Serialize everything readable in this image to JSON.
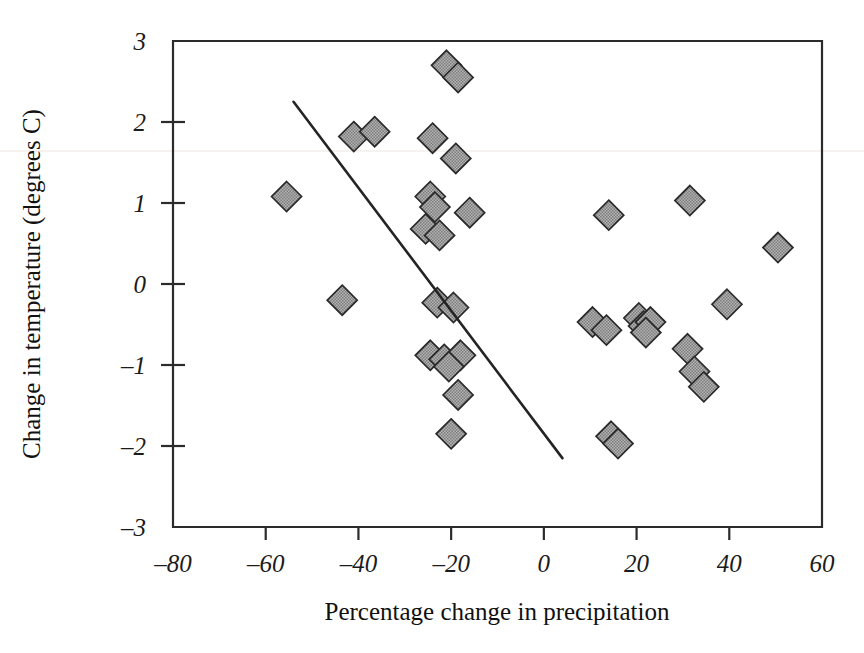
{
  "figure": {
    "background_color": "#ffffff",
    "ink_color": "#2b2b2b"
  },
  "chart_data": {
    "type": "scatter",
    "title": "",
    "subtitle": "",
    "xlabel": "Percentage change in precipitation",
    "ylabel": "Change in temperature (degrees C)",
    "xlim": [
      -80,
      60
    ],
    "ylim": [
      -3,
      3
    ],
    "xticks": [
      -80,
      -60,
      -40,
      -20,
      0,
      20,
      40,
      60
    ],
    "xtick_labels": [
      "–80",
      "–60",
      "–40",
      "–20",
      "0",
      "20",
      "40",
      "60"
    ],
    "yticks": [
      -3,
      -2,
      -1,
      0,
      1,
      2,
      3
    ],
    "ytick_labels": [
      "–3",
      "–2",
      "–1",
      "0",
      "1",
      "2",
      "3"
    ],
    "grid": false,
    "legend": null,
    "legend_position": "none",
    "marker_style": "diamond",
    "marker_fill": "#9a9a9a",
    "marker_edge": "#2a2a2a",
    "marker_size_px": 30,
    "series": [
      {
        "name": "GCM scenarios",
        "points": [
          [
            -21.0,
            2.7
          ],
          [
            -18.5,
            2.55
          ],
          [
            -41.0,
            1.82
          ],
          [
            -36.5,
            1.88
          ],
          [
            -24.0,
            1.8
          ],
          [
            -19.0,
            1.55
          ],
          [
            -55.5,
            1.08
          ],
          [
            -24.5,
            1.08
          ],
          [
            -23.5,
            0.95
          ],
          [
            -16.0,
            0.88
          ],
          [
            -25.5,
            0.68
          ],
          [
            -22.5,
            0.6
          ],
          [
            14.0,
            0.85
          ],
          [
            31.5,
            1.03
          ],
          [
            50.5,
            0.45
          ],
          [
            -43.5,
            -0.2
          ],
          [
            -23.0,
            -0.23
          ],
          [
            -19.5,
            -0.29
          ],
          [
            -24.5,
            -0.88
          ],
          [
            -21.5,
            -0.93
          ],
          [
            -18.0,
            -0.88
          ],
          [
            -20.5,
            -1.02
          ],
          [
            -18.5,
            -1.37
          ],
          [
            -20.0,
            -1.85
          ],
          [
            14.5,
            -1.88
          ],
          [
            16.0,
            -1.97
          ],
          [
            10.5,
            -0.47
          ],
          [
            13.5,
            -0.57
          ],
          [
            20.5,
            -0.42
          ],
          [
            21.5,
            -0.52
          ],
          [
            23.0,
            -0.47
          ],
          [
            22.0,
            -0.6
          ],
          [
            39.5,
            -0.25
          ],
          [
            31.0,
            -0.8
          ],
          [
            32.5,
            -1.08
          ],
          [
            34.5,
            -1.27
          ]
        ]
      }
    ],
    "trend_line": {
      "description": "fitted linear regression line",
      "x_start": -54.0,
      "y_start": 2.25,
      "x_end": 4.0,
      "y_end": -2.15
    }
  }
}
